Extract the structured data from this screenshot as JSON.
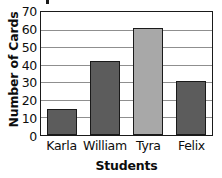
{
  "chart_data": {
    "type": "bar",
    "title": "",
    "categories": [
      "Karla",
      "William",
      "Tyra",
      "Felix"
    ],
    "values": [
      15,
      42,
      61,
      31
    ],
    "series": [
      {
        "name": "Number of Cards",
        "values": [
          15,
          42,
          61,
          31
        ]
      }
    ],
    "xlabel": "Students",
    "ylabel": "Number of Cards",
    "ylim": [
      0,
      70
    ],
    "ytick_values": [
      0,
      10,
      20,
      30,
      40,
      50,
      60,
      70
    ],
    "ytick_labels": [
      "0",
      "10",
      "20",
      "30",
      "40",
      "50",
      "60",
      "70"
    ],
    "grid": true,
    "grid_axis": "y",
    "legend": false,
    "bar_colors": [
      "#5c5c5c",
      "#5c5c5c",
      "#a8a8a8",
      "#5c5c5c"
    ],
    "bar_edge_color": "#1a1a1a",
    "grid_color": "#8f8f8f",
    "axis_color": "#1a1a1a",
    "background": "#ffffff"
  }
}
